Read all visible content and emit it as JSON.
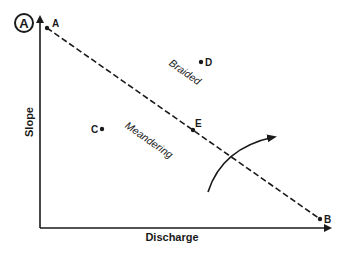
{
  "figure": {
    "panel_label": "A",
    "axes": {
      "x_label": "Discharge",
      "y_label": "Slope"
    },
    "threshold_line": {
      "start_point": "A",
      "end_point": "B",
      "style": "dashed"
    },
    "regions": [
      {
        "label": "Braided",
        "position": "above line"
      },
      {
        "label": "Meandering",
        "position": "below line"
      }
    ],
    "points": [
      {
        "label": "A",
        "note": "start of threshold line"
      },
      {
        "label": "B",
        "note": "end of threshold line"
      },
      {
        "label": "C",
        "note": "meandering region"
      },
      {
        "label": "D",
        "note": "braided region"
      },
      {
        "label": "E",
        "note": "on threshold line"
      }
    ],
    "arrow": {
      "description": "curved arrow crossing threshold from meandering to braided"
    }
  },
  "colors": {
    "ink": "#1a1a1a",
    "background": "#ffffff"
  }
}
